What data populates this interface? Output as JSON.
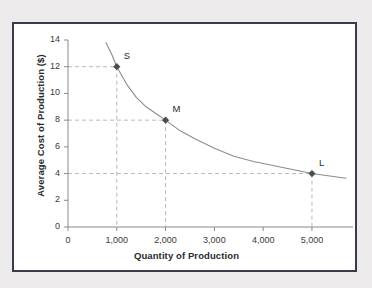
{
  "chart_data": {
    "type": "line",
    "title": "",
    "xlabel": "Quantity of Production",
    "ylabel": "Average Cost of Production ($)",
    "xlim": [
      0,
      5800
    ],
    "ylim": [
      0,
      14
    ],
    "grid": false,
    "guide_lines": "dashed gray drop-lines from each labeled point to both axes",
    "xticks": [
      0,
      1000,
      2000,
      3000,
      4000,
      5000
    ],
    "xtick_labels": [
      "0",
      "1,000",
      "2,000",
      "3,000",
      "4,000",
      "5,000"
    ],
    "yticks": [
      0,
      2,
      4,
      6,
      8,
      10,
      12,
      14
    ],
    "ytick_labels": [
      "0",
      "2",
      "4",
      "6",
      "8",
      "10",
      "12",
      "14"
    ],
    "series": [
      {
        "name": "Average cost curve",
        "type": "line",
        "color": "#8c8c8c",
        "x": [
          780,
          900,
          1000,
          1200,
          1400,
          1600,
          1800,
          2000,
          2300,
          2600,
          3000,
          3400,
          3800,
          4200,
          4600,
          5000,
          5400,
          5700
        ],
        "y": [
          13.8,
          12.9,
          12.0,
          10.7,
          9.7,
          9.0,
          8.5,
          8.0,
          7.2,
          6.6,
          5.9,
          5.3,
          4.9,
          4.6,
          4.3,
          4.0,
          3.8,
          3.65
        ]
      }
    ],
    "points": [
      {
        "label": "S",
        "x": 1000,
        "y": 12,
        "marker": "diamond",
        "color": "#4d4d4d"
      },
      {
        "label": "M",
        "x": 2000,
        "y": 8,
        "marker": "diamond",
        "color": "#4d4d4d"
      },
      {
        "label": "L",
        "x": 5000,
        "y": 4,
        "marker": "diamond",
        "color": "#4d4d4d"
      }
    ]
  },
  "colors": {
    "frame_border": "#3b3a4a",
    "page_background": "#eceaea",
    "plot_background": "#ffffff",
    "axis": "#8a8a8a",
    "curve": "#8c8c8c",
    "guide_line": "#b9b9b9",
    "marker": "#4d4d4d",
    "text": "#2a2a2a"
  }
}
